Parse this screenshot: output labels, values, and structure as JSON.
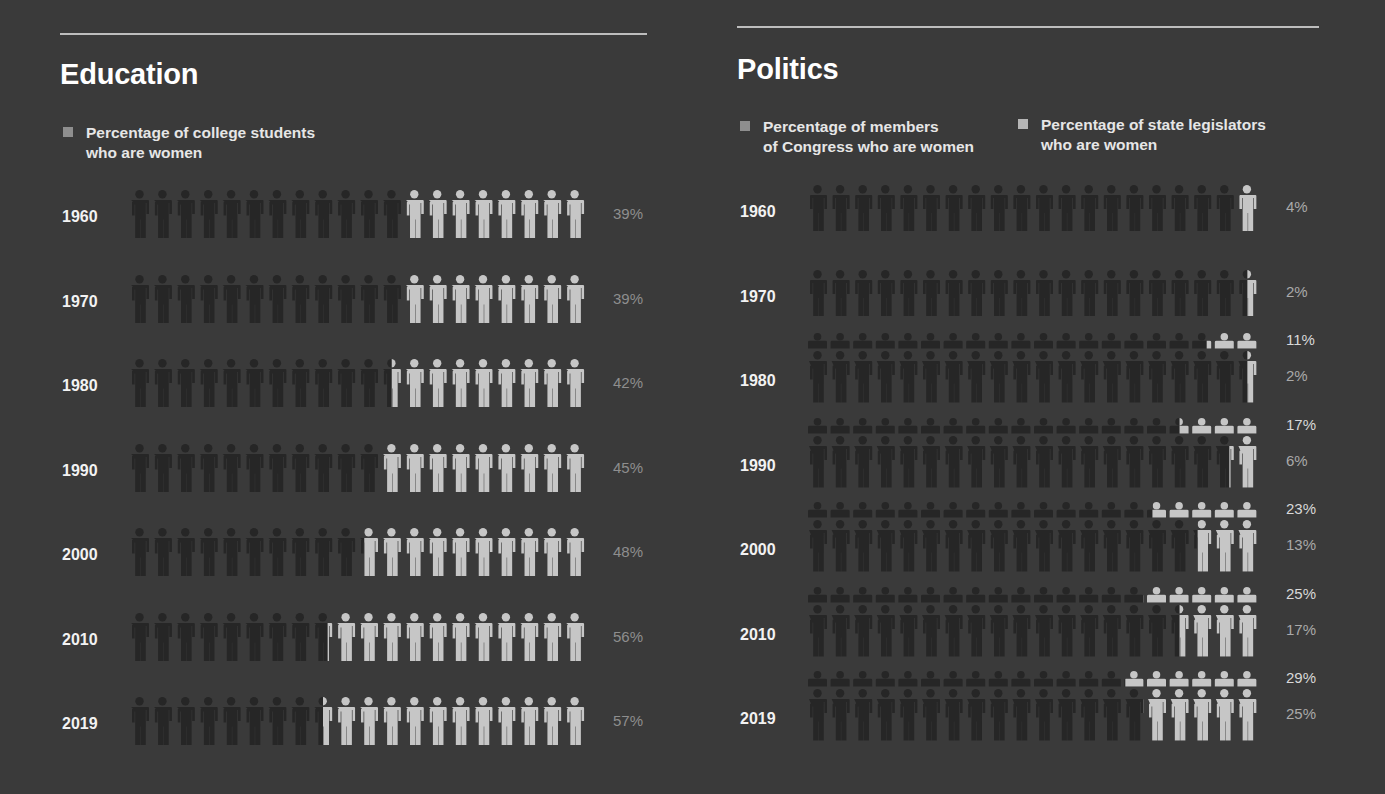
{
  "education": {
    "title": "Education",
    "legend": [
      {
        "line1": "Percentage of college students",
        "line2": "who are women",
        "color": "#8e8e8e"
      }
    ],
    "rows": [
      {
        "year": "1960",
        "value": 39,
        "label": "39%"
      },
      {
        "year": "1970",
        "value": 39,
        "label": "39%"
      },
      {
        "year": "1980",
        "value": 42,
        "label": "42%"
      },
      {
        "year": "1990",
        "value": 45,
        "label": "45%"
      },
      {
        "year": "2000",
        "value": 48,
        "label": "48%"
      },
      {
        "year": "2010",
        "value": 56,
        "label": "56%"
      },
      {
        "year": "2019",
        "value": 57,
        "label": "57%"
      }
    ]
  },
  "politics": {
    "title": "Politics",
    "legend": [
      {
        "line1": "Percentage of members",
        "line2": "of Congress who are women",
        "color": "#8e8e8e"
      },
      {
        "line1": "Percentage of state legislators",
        "line2": "who are women",
        "color": "#b5b5b5"
      }
    ],
    "rows": [
      {
        "year": "1960",
        "congress": 4,
        "congress_label": "4%",
        "state": null,
        "state_label": null
      },
      {
        "year": "1970",
        "congress": 2,
        "congress_label": "2%",
        "state": null,
        "state_label": null
      },
      {
        "year": "1980",
        "congress": 2,
        "congress_label": "2%",
        "state": 11,
        "state_label": "11%"
      },
      {
        "year": "1990",
        "congress": 6,
        "congress_label": "6%",
        "state": 17,
        "state_label": "17%"
      },
      {
        "year": "2000",
        "congress": 13,
        "congress_label": "13%",
        "state": 23,
        "state_label": "23%"
      },
      {
        "year": "2010",
        "congress": 17,
        "congress_label": "17%",
        "state": 25,
        "state_label": "25%"
      },
      {
        "year": "2019",
        "congress": 25,
        "congress_label": "25%",
        "state": 29,
        "state_label": "29%"
      }
    ]
  },
  "colors": {
    "background": "#3a3a3a",
    "figure_dark": "#262626",
    "figure_light": "#c6c6c6",
    "rule": "#bdbdbd"
  },
  "chart_data": [
    {
      "type": "bar",
      "title": "Education",
      "subtitle": "Percentage of college students who are women",
      "categories": [
        "1960",
        "1970",
        "1980",
        "1990",
        "2000",
        "2010",
        "2019"
      ],
      "values": [
        39,
        39,
        42,
        45,
        48,
        56,
        57
      ],
      "xlabel": "",
      "ylabel": "Percent",
      "ylim": [
        0,
        100
      ],
      "notes": "Pictogram: 20 figures per row, each = 5%; lit figures fill from right"
    },
    {
      "type": "bar",
      "title": "Politics",
      "categories": [
        "1960",
        "1970",
        "1980",
        "1990",
        "2000",
        "2010",
        "2019"
      ],
      "series": [
        {
          "name": "Percentage of members of Congress who are women",
          "values": [
            4,
            2,
            2,
            6,
            13,
            17,
            25
          ]
        },
        {
          "name": "Percentage of state legislators who are women",
          "values": [
            null,
            null,
            11,
            17,
            23,
            25,
            29
          ]
        }
      ],
      "xlabel": "",
      "ylabel": "Percent",
      "ylim": [
        0,
        100
      ],
      "legend_position": "top",
      "notes": "Pictogram: 20 figures per row, each = 5%; state legislators shown as half-figures above Congress row"
    }
  ]
}
